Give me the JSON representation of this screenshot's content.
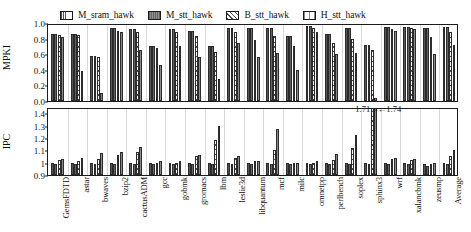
{
  "legend": {
    "items": [
      {
        "label": "M_sram_hawk",
        "swatch": "sram-pattern-swatch",
        "color": "#ffffff"
      },
      {
        "label": "M_stt_hawk",
        "swatch": "mstt-solid-swatch",
        "color": "#8e8e8e"
      },
      {
        "label": "B_stt_hawk",
        "swatch": "bstt-hatch-swatch",
        "color": "#ffffff"
      },
      {
        "label": "H_stt_hawk",
        "swatch": "hstt-pattern-swatch",
        "color": "#ffffff"
      }
    ]
  },
  "annotations": [
    {
      "text": "1.71→",
      "panel": "ipc",
      "x_pct": 75.0,
      "y_pct": -6
    },
    {
      "text": "←1.74",
      "panel": "ipc",
      "x_pct": 80.5,
      "y_pct": -6
    }
  ],
  "chart_data": [
    {
      "type": "bar",
      "id": "mpki",
      "title": "",
      "xlabel": "",
      "ylabel": "MPKI",
      "ylim": [
        0.0,
        1.0
      ],
      "yticks": [
        "0.0",
        "0.2",
        "0.4",
        "0.6",
        "0.8",
        "1.0"
      ],
      "ytickvals": [
        0.0,
        0.2,
        0.4,
        0.6,
        0.8,
        1.0
      ],
      "grid": false,
      "legend_position": "top",
      "categories": [
        "GemsFDTD",
        "astar",
        "bwaves",
        "bzip2",
        "cactusADM",
        "gcc",
        "gobmk",
        "gromacs",
        "lbm",
        "leslie3d",
        "libquantum",
        "mcf",
        "milc",
        "omnetpp",
        "perlbench",
        "soplex",
        "sphinx3",
        "wrf",
        "xalancbmk",
        "zeusmp",
        "Average"
      ],
      "series": [
        {
          "name": "M_sram_hawk",
          "values": [
            0.86,
            0.86,
            0.58,
            0.93,
            0.92,
            0.7,
            0.92,
            0.9,
            0.7,
            0.93,
            0.93,
            0.93,
            0.83,
            0.96,
            0.86,
            0.93,
            0.72,
            0.95,
            0.95,
            0.93,
            0.95
          ]
        },
        {
          "name": "M_stt_hawk",
          "values": [
            0.86,
            0.86,
            0.58,
            0.93,
            0.92,
            0.7,
            0.92,
            0.9,
            0.7,
            0.93,
            0.93,
            0.93,
            0.83,
            0.96,
            0.86,
            0.93,
            0.72,
            0.95,
            0.95,
            0.93,
            0.95
          ]
        },
        {
          "name": "B_stt_hawk",
          "values": [
            0.85,
            0.85,
            0.56,
            0.9,
            0.88,
            0.68,
            0.88,
            0.83,
            0.63,
            0.88,
            0.78,
            0.83,
            0.7,
            0.93,
            0.74,
            0.8,
            0.66,
            0.92,
            0.93,
            0.82,
            0.88
          ]
        },
        {
          "name": "H_stt_hawk",
          "values": [
            0.82,
            0.38,
            0.1,
            0.88,
            0.66,
            0.46,
            0.7,
            0.56,
            0.28,
            0.74,
            0.56,
            0.62,
            0.4,
            0.88,
            0.6,
            0.62,
            0.04,
            0.9,
            0.92,
            0.6,
            0.72
          ]
        }
      ]
    },
    {
      "type": "bar",
      "id": "ipc",
      "title": "",
      "xlabel": "",
      "ylabel": "IPC",
      "ylim": [
        0.9,
        1.45
      ],
      "yticks": [
        "0.9",
        "1",
        "1.1",
        "1.2",
        "1.3",
        "1.4"
      ],
      "ytickvals": [
        0.9,
        1.0,
        1.1,
        1.2,
        1.3,
        1.4
      ],
      "grid": false,
      "legend_position": "top",
      "categories": [
        "GemsFDTD",
        "astar",
        "bwaves",
        "bzip2",
        "cactusADM",
        "gcc",
        "gobmk",
        "gromacs",
        "lbm",
        "leslie3d",
        "libquantum",
        "mcf",
        "milc",
        "omnetpp",
        "perlbench",
        "soplex",
        "sphinx3",
        "wrf",
        "xalancbmk",
        "zeusmp",
        "Average"
      ],
      "series": [
        {
          "name": "M_sram_hawk",
          "values": [
            1.0,
            1.0,
            1.0,
            1.0,
            1.0,
            1.0,
            1.0,
            1.0,
            1.0,
            1.0,
            1.0,
            1.0,
            1.0,
            1.0,
            1.0,
            1.0,
            1.0,
            1.0,
            1.0,
            0.99,
            1.0
          ]
        },
        {
          "name": "M_stt_hawk",
          "values": [
            0.99,
            0.99,
            0.99,
            0.99,
            0.99,
            0.99,
            0.99,
            0.99,
            0.99,
            0.99,
            0.99,
            0.99,
            0.99,
            0.99,
            0.99,
            0.99,
            0.99,
            0.99,
            0.99,
            0.97,
            0.99
          ]
        },
        {
          "name": "B_stt_hawk",
          "values": [
            1.02,
            1.01,
            1.03,
            1.06,
            1.09,
            1.0,
            1.0,
            1.05,
            1.18,
            1.04,
            1.01,
            1.1,
            1.0,
            1.0,
            1.02,
            1.12,
            1.45,
            1.03,
            1.02,
            0.99,
            1.05
          ]
        },
        {
          "name": "H_stt_hawk",
          "values": [
            1.03,
            1.04,
            1.08,
            1.09,
            1.13,
            1.01,
            1.01,
            1.06,
            1.3,
            1.05,
            1.01,
            1.27,
            1.0,
            1.01,
            1.07,
            1.22,
            1.45,
            1.04,
            1.03,
            1.0,
            1.1
          ]
        }
      ],
      "overflow_labels": {
        "sphinx3": {
          "B_stt_hawk": "1.71→",
          "H_stt_hawk": "←1.74"
        }
      }
    }
  ]
}
